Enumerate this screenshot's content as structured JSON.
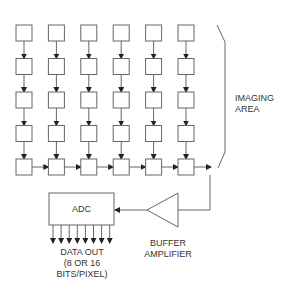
{
  "diagram": {
    "imaging_area_label": "IMAGING\nAREA",
    "adc_label": "ADC",
    "data_out_label": "DATA OUT\n(8 OR 16\nBITS/PIXEL)",
    "buffer_label": "BUFFER\nAMPLIFIER",
    "grid": {
      "columns": 6,
      "rows": 5
    },
    "output_bits_arrows": 8,
    "colors": {
      "line": "#666666",
      "arrow": "#222222",
      "text": "#333333",
      "background": "#ffffff"
    }
  }
}
